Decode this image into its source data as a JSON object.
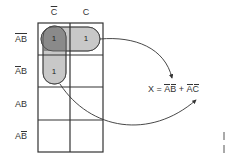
{
  "kmap": {
    "columns": [
      {
        "label": "C",
        "overline": true
      },
      {
        "label": "C",
        "overline": false
      }
    ],
    "rows": [
      {
        "label": "AB",
        "overline_a": true,
        "overline_b": true
      },
      {
        "label": "AB",
        "overline_a": true,
        "overline_b": false
      },
      {
        "label": "AB",
        "overline_a": false,
        "overline_b": false
      },
      {
        "label": "AB",
        "overline_a": false,
        "overline_b": true
      }
    ],
    "cells": [
      [
        "1",
        "1"
      ],
      [
        "1",
        ""
      ],
      [
        "",
        ""
      ],
      [
        "",
        ""
      ]
    ],
    "groups": [
      {
        "name": "group-A-bar-B-bar",
        "cells": "row 0, both columns",
        "term": "AB (A̅B̅)"
      },
      {
        "name": "group-A-bar-C-bar",
        "cells": "column 0, rows 0-1",
        "term": "AC (A̅C̅)"
      }
    ]
  },
  "equation": {
    "lhs": "X = ",
    "term1": "AB",
    "plus": " + ",
    "term2": "AC"
  },
  "colors": {
    "grid": "#333333",
    "group_fill": "#c8c8c8",
    "overlap_fill": "#8a8a8a",
    "arrow": "#333333"
  }
}
